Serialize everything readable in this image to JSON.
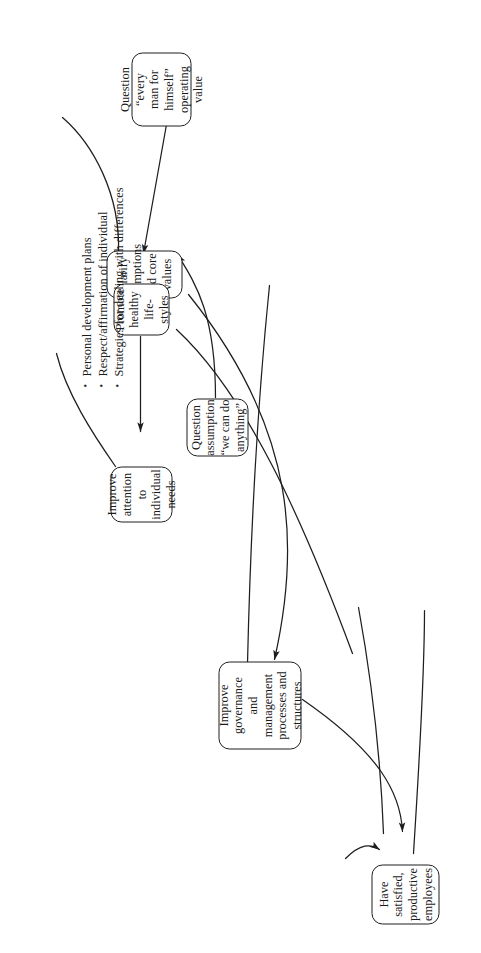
{
  "diagram": {
    "type": "influence-diagram",
    "orientation": "rotated-90-counterclockwise",
    "background_color": "#ffffff",
    "line_color": "#1e1e1e",
    "text_color": "#1a1a1a",
    "nodes": [
      {
        "id": "clarify",
        "label": "Clarify assumptions and core values",
        "lines": [
          "Clarify",
          "assumptions",
          "and core",
          "values"
        ]
      },
      {
        "id": "question-every-man",
        "label": "Question “every man for himself” operating value",
        "lines": [
          "Question “every",
          "man for himself”",
          "operating value"
        ]
      },
      {
        "id": "question-anything",
        "label": "Question assumption “we can do anything”",
        "lines": [
          "Question",
          "assumption",
          "“we can do",
          "anything”"
        ]
      },
      {
        "id": "improve-attention",
        "label": "Improve attention to individual needs",
        "lines": [
          "Improve",
          "attention to",
          "individual",
          "needs"
        ]
      },
      {
        "id": "promote-healthy",
        "label": "Promote healthy life-styles",
        "lines": [
          "Promote",
          "healthy",
          "life-styles"
        ]
      },
      {
        "id": "improve-governance",
        "label": "Improve governance and management processes and structures",
        "lines": [
          "Improve",
          "governance and",
          "management",
          "processes and",
          "structures"
        ]
      },
      {
        "id": "have-satisfied",
        "label": "Have satisfied, productive employees",
        "lines": [
          "Have",
          "satisfied,",
          "productive",
          "employees"
        ]
      }
    ],
    "annotation": {
      "id": "attention-bullets",
      "attached_to": "improve-attention",
      "bullets": [
        "Personal development plans",
        "Respect/affirmation of individual",
        "Strategies for dealing with differences"
      ]
    },
    "edges": [
      {
        "from": "question-every-man",
        "to": "clarify",
        "arrow": true
      },
      {
        "from": "question-anything",
        "to": "clarify",
        "arrow": true
      },
      {
        "from": "clarify",
        "to": "improve-governance",
        "arrow": true
      },
      {
        "from": "promote-healthy",
        "to": "improve-attention",
        "arrow": true
      },
      {
        "from": "improve-governance",
        "to": "have-satisfied",
        "arrow": true
      },
      {
        "from": "off-canvas",
        "to": "have-satisfied",
        "arrow": true
      },
      {
        "from": "clarify",
        "to": "off-canvas",
        "arrow": false
      },
      {
        "from": "improve-attention",
        "to": "off-canvas",
        "arrow": false
      },
      {
        "from": "promote-healthy",
        "to": "off-canvas",
        "arrow": false
      },
      {
        "from": "improve-governance",
        "to": "off-canvas",
        "arrow": false
      },
      {
        "from": "have-satisfied",
        "to": "off-canvas",
        "arrow": false
      }
    ]
  }
}
